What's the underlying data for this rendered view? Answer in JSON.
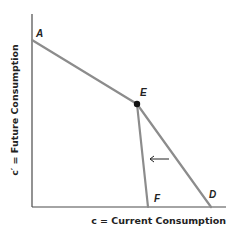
{
  "diagram": {
    "type": "budget-constraint",
    "axes": {
      "x_label": "c = Current Consumption",
      "y_label": "c′ = Future Consumption"
    },
    "points": {
      "A": {
        "label": "A",
        "x": 32,
        "y": 40
      },
      "E": {
        "label": "E",
        "x": 137,
        "y": 104
      },
      "F": {
        "label": "F",
        "x": 148,
        "y": 207
      },
      "D": {
        "label": "D",
        "x": 211,
        "y": 207
      }
    },
    "segments": [
      {
        "from": "A",
        "to": "E"
      },
      {
        "from": "E",
        "to": "F"
      },
      {
        "from": "E",
        "to": "D"
      }
    ],
    "shift_arrow": {
      "direction": "left"
    },
    "colors": {
      "axis": "#4a4a4a",
      "curve": "#8c8c8c",
      "point": "#111111",
      "text": "#222222"
    }
  }
}
